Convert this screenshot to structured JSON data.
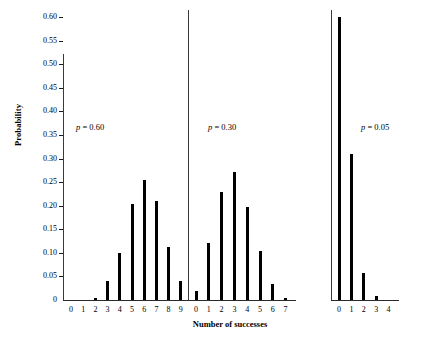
{
  "chart_data": {
    "type": "bar",
    "title": "",
    "xlabel": "Number of successes",
    "ylabel": "Probability",
    "ylim": [
      0,
      0.6
    ],
    "grid": false,
    "legend": "none",
    "y_ticks": [
      "0",
      "0.05",
      "0.10",
      "0.15",
      "0.20",
      "0.25",
      "0.30",
      "0.35",
      "0.40",
      "0.45",
      "0.50",
      "0.55",
      "0.60"
    ],
    "y_tick_values": [
      0,
      0.05,
      0.1,
      0.15,
      0.2,
      0.25,
      0.3,
      0.35,
      0.4,
      0.45,
      0.5,
      0.55,
      0.6
    ],
    "panels": [
      {
        "annotation": "p = 0.60",
        "p_symbol": "p",
        "p_equals": "= 0.60",
        "categories": [
          "0",
          "1",
          "2",
          "3",
          "4",
          "5",
          "6",
          "7",
          "8",
          "9"
        ],
        "values": [
          0.0,
          0.001,
          0.004,
          0.021,
          0.074,
          0.167,
          0.251,
          0.161,
          0.06,
          0.01
        ],
        "plotted_values": [
          0.0,
          0.0,
          0.004,
          0.04,
          0.1,
          0.203,
          0.255,
          0.21,
          0.112,
          0.04
        ]
      },
      {
        "annotation": "p = 0.30",
        "p_symbol": "p",
        "p_equals": "= 0.30",
        "categories": [
          "0",
          "1",
          "2",
          "3",
          "4",
          "5",
          "6",
          "7"
        ],
        "values": [
          0.082,
          0.247,
          0.318,
          0.227,
          0.097,
          0.025,
          0.004,
          0.0
        ],
        "plotted_values": [
          0.02,
          0.12,
          0.23,
          0.272,
          0.198,
          0.103,
          0.034,
          0.004
        ]
      },
      {
        "annotation": "p = 0.05",
        "p_symbol": "p",
        "p_equals": "= 0.05",
        "categories": [
          "0",
          "1",
          "2",
          "3",
          "4"
        ],
        "values": [
          0.815,
          0.171,
          0.014,
          0.0,
          0.0
        ],
        "plotted_values": [
          0.6,
          0.31,
          0.058,
          0.008,
          0.0
        ]
      }
    ]
  }
}
